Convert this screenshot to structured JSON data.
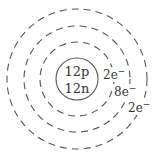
{
  "diagram": {
    "type": "bohr-atom-model",
    "nucleus": {
      "protons": "12p",
      "neutrons": "12n"
    },
    "shells": [
      {
        "index": 1,
        "electrons": "2e",
        "charge_sup": "−"
      },
      {
        "index": 2,
        "electrons": "8e",
        "charge_sup": "−"
      },
      {
        "index": 3,
        "electrons": "2e",
        "charge_sup": "−"
      }
    ],
    "colors": {
      "stroke": "#555555",
      "text": "#333333",
      "background": "#ffffff"
    }
  }
}
